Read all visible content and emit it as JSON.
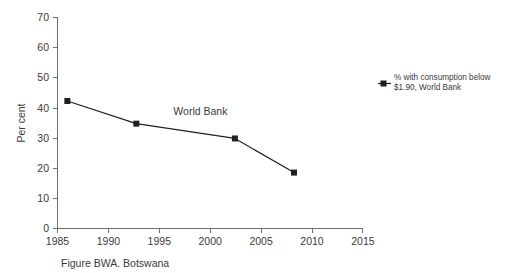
{
  "chart_data": {
    "type": "line",
    "title": "",
    "subtitle": "",
    "xlabel": "",
    "ylabel": "Per cent",
    "xlim": [
      1985,
      2016
    ],
    "ylim": [
      0,
      70
    ],
    "grid": false,
    "legend_position": "right",
    "x_ticks": [
      "1985",
      "1990",
      "1995",
      "2000",
      "2005",
      "2010",
      "2015"
    ],
    "x_tick_values": [
      1985,
      1990,
      1995,
      2000,
      2005,
      2010,
      2015
    ],
    "y_ticks": [
      "0",
      "10",
      "20",
      "30",
      "40",
      "50",
      "60",
      "70"
    ],
    "y_tick_values": [
      0,
      10,
      20,
      30,
      40,
      50,
      60,
      70
    ],
    "series": [
      {
        "name": "% with consumption below $1.90, World Bank",
        "marker": "square",
        "color": "#231f20",
        "x": [
          1986,
          1993,
          2003,
          2009
        ],
        "values": [
          42.2,
          34.7,
          29.8,
          18.5
        ]
      }
    ],
    "annotations": [
      {
        "name": "series-inline-label",
        "text": "World Bank",
        "x": 1999.5,
        "y": 37.5
      }
    ]
  },
  "axes": {
    "y_axis_title": "Per cent"
  },
  "legend": {
    "entries": [
      {
        "line1": "% with consumption below",
        "line2": "$1.90, World Bank",
        "marker": "square",
        "color": "#231f20"
      }
    ]
  },
  "caption": {
    "text": "Figure BWA. Botswana"
  }
}
